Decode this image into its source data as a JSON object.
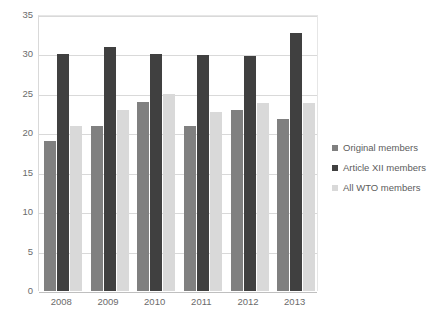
{
  "chart_data": {
    "type": "bar",
    "title": "",
    "xlabel": "",
    "ylabel": "",
    "categories": [
      "2008",
      "2009",
      "2010",
      "2011",
      "2012",
      "2013"
    ],
    "series": [
      {
        "name": "Original members",
        "color": "#808080",
        "values": [
          19.0,
          20.9,
          24.0,
          20.9,
          22.9,
          21.8
        ]
      },
      {
        "name": "Article XII members",
        "color": "#404040",
        "values": [
          30.0,
          31.0,
          30.0,
          29.9,
          29.8,
          32.7
        ]
      },
      {
        "name": "All WTO members",
        "color": "#d9d9d9",
        "values": [
          20.9,
          22.9,
          25.0,
          22.7,
          23.8,
          23.9
        ]
      }
    ],
    "ylim": [
      0,
      35
    ],
    "y_ticks": [
      0,
      5,
      10,
      15,
      20,
      25,
      30,
      35
    ],
    "y_tick_labels": [
      "0",
      "5",
      "10",
      "15",
      "20",
      "25",
      "30",
      "35"
    ],
    "grid": true,
    "legend_position": "right"
  },
  "legend": {
    "entries": [
      {
        "label": "Original members"
      },
      {
        "label": "Article XII members"
      },
      {
        "label": "All WTO members"
      }
    ]
  }
}
